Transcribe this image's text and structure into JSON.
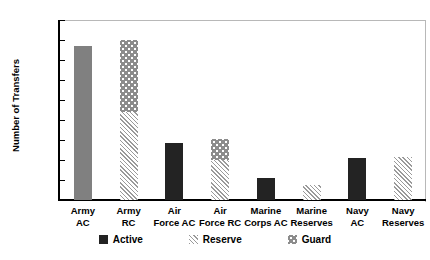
{
  "chart_data": {
    "type": "bar",
    "title": "",
    "xlabel": "",
    "ylabel": "Number of Transfers",
    "ylim": [
      0,
      90000
    ],
    "ytick_step": 10000,
    "grid": false,
    "stacked": true,
    "legend_position": "bottom",
    "categories": [
      "Army AC",
      "Army RC",
      "Air Force AC",
      "Air Force RC",
      "Marine Corps AC",
      "Marine Reserves",
      "Navy AC",
      "Navy Reserves"
    ],
    "category_lines": [
      [
        "Army",
        "AC"
      ],
      [
        "Army",
        "RC"
      ],
      [
        "Air",
        "Force AC"
      ],
      [
        "Air",
        "Force RC"
      ],
      [
        "Marine",
        "Corps AC"
      ],
      [
        "Marine",
        "Reserves"
      ],
      [
        "Navy",
        "AC"
      ],
      [
        "Navy",
        "Reserves"
      ]
    ],
    "ytick_labels": [
      "90,000",
      "80,000",
      "70,000",
      "60,000",
      "50,000",
      "40,000",
      "30,000",
      "20,000",
      "10,000",
      "0"
    ],
    "series": [
      {
        "name": "Active",
        "values": [
          77000,
          0,
          28500,
          0,
          11000,
          0,
          21000,
          0
        ]
      },
      {
        "name": "Reserve",
        "values": [
          0,
          44000,
          0,
          20000,
          0,
          7500,
          0,
          21500
        ]
      },
      {
        "name": "Guard",
        "values": [
          0,
          36000,
          0,
          10500,
          0,
          0,
          0,
          0
        ]
      }
    ],
    "bar_totals": [
      77000,
      80000,
      28500,
      30500,
      11000,
      7500,
      21000,
      21500
    ],
    "colors": {
      "active_light": "#808080",
      "active_dark": "#232323",
      "reserve": "#9a9a9a",
      "guard": "#8c8c8c",
      "axis": "#000000",
      "frame": "#b8b8b8",
      "background": "#ffffff"
    }
  },
  "legend": {
    "items": [
      {
        "label": "Active",
        "swatch": "solid-dark-swatch"
      },
      {
        "label": "Reserve",
        "swatch": "diagonal-hatch-swatch"
      },
      {
        "label": "Guard",
        "swatch": "dotted-swatch"
      }
    ]
  }
}
